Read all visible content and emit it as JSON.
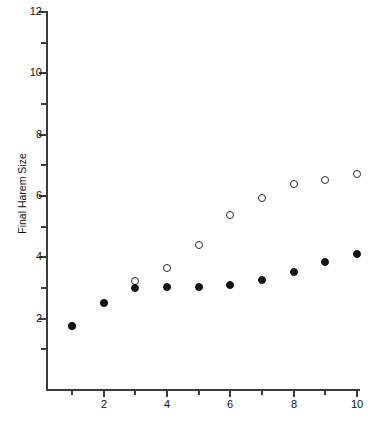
{
  "chart_data": {
    "type": "scatter",
    "title": "",
    "xlabel": "",
    "ylabel": "Final Harem Size",
    "xlim": [
      0.3,
      10.5
    ],
    "ylim": [
      0.6,
      12
    ],
    "grid": false,
    "legend": "none",
    "x": [
      1,
      2,
      3,
      4,
      5,
      6,
      7,
      8,
      9,
      10
    ],
    "xticks": [
      1,
      2,
      3,
      4,
      5,
      6,
      7,
      8,
      9,
      10
    ],
    "xtick_labels": [
      "",
      "2",
      "",
      "4",
      "",
      "6",
      "",
      "8",
      "",
      "10"
    ],
    "yticks": [
      2,
      3,
      4,
      5,
      6,
      7,
      8,
      9,
      10,
      11,
      12
    ],
    "ytick_labels": [
      "2",
      "",
      "4",
      "",
      "6",
      "",
      "8",
      "",
      "10",
      "",
      "12"
    ],
    "series": [
      {
        "name": "open-circles",
        "marker": "open-circle",
        "color": "#2b2b2b",
        "values": [
          1.45,
          3.0,
          4.4,
          5.25,
          6.75,
          8.7,
          9.8,
          10.75,
          11.0,
          11.4
        ]
      },
      {
        "name": "filled-circles",
        "marker": "filled-circle",
        "color": "#111111",
        "values": [
          1.45,
          3.0,
          3.95,
          4.03,
          4.0,
          4.15,
          4.45,
          4.98,
          5.65,
          6.15
        ]
      }
    ]
  },
  "axis": {
    "y_title": "Final Harem Size",
    "y_labels": [
      "12",
      "10",
      "8",
      "6",
      "4",
      "2"
    ],
    "x_labels": [
      "2",
      "4",
      "6",
      "8",
      "10"
    ]
  },
  "colors": {
    "axis": "#3a3a3a",
    "text": "#111111",
    "marker_fill": "#111111",
    "marker_open_stroke": "#2b2b2b",
    "background": "#ffffff"
  }
}
